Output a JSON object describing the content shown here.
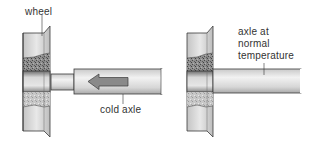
{
  "diagram": {
    "panels": [
      {
        "id": "before",
        "labels": {
          "wheel": "wheel",
          "axle": "cold axle"
        },
        "arrow_direction": "left"
      },
      {
        "id": "after",
        "labels": {
          "axle_line1": "axle at",
          "axle_line2": "normal",
          "axle_line3": "temperature"
        }
      }
    ],
    "colors": {
      "outline": "#3a3a3a",
      "metal_light": "#e4e4e4",
      "metal_mid": "#b8b8b8",
      "arrow_fill": "#8a8a8a",
      "background": "#ffffff"
    }
  }
}
